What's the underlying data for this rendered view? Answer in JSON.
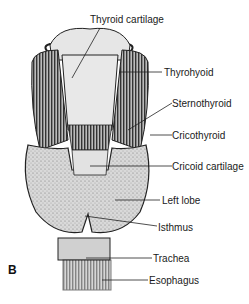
{
  "figure": {
    "panel_letter": "B",
    "labels": [
      {
        "id": "thyroid-cartilage",
        "text": "Thyroid cartilage"
      },
      {
        "id": "thyrohyoid",
        "text": "Thyrohyoid"
      },
      {
        "id": "sternothyroid",
        "text": "Sternothyroid"
      },
      {
        "id": "cricothyroid",
        "text": "Cricothyroid"
      },
      {
        "id": "cricoid-cartilage",
        "text": "Cricoid cartilage"
      },
      {
        "id": "left-lobe",
        "text": "Left lobe"
      },
      {
        "id": "isthmus",
        "text": "Isthmus"
      },
      {
        "id": "trachea",
        "text": "Trachea"
      },
      {
        "id": "esophagus",
        "text": "Esophagus"
      }
    ]
  }
}
